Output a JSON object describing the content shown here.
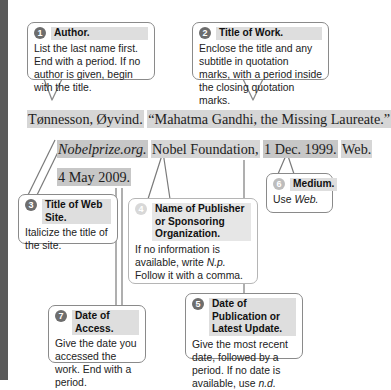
{
  "citation": {
    "line1": {
      "author": "Tønnesson, Øyvind.",
      "title_of_work": "“Mahatma Gandhi, the Missing Laureate.”"
    },
    "line2": {
      "web_site_title": "Nobelprize.org.",
      "publisher": "Nobel Foundation,",
      "pub_date": "1 Dec. 1999.",
      "medium": "Web."
    },
    "line3": {
      "access_date": "4 May 2009."
    }
  },
  "callouts": [
    {
      "number": "1",
      "title": "Author.",
      "body": "List the last name first. End with a period. If no author is given, begin with the title."
    },
    {
      "number": "2",
      "title": "Title of Work.",
      "body": "Enclose the title and any subtitle in quotation marks, with a period inside the closing quotation marks."
    },
    {
      "number": "3",
      "title": "Title of Web Site.",
      "body": "Italicize the title of the site."
    },
    {
      "number": "4",
      "title": "Name of Publisher or Sponsoring Organization.",
      "body_pre": "If no information is available, write ",
      "body_em": "N.p.",
      "body_post": " Follow it with a comma."
    },
    {
      "number": "5",
      "title": "Date of Publication or Latest Update.",
      "body_pre": "Give the most recent date, followed by a period. If no date is available, use ",
      "body_em": "n.d."
    },
    {
      "number": "6",
      "title": "Medium.",
      "body_pre": "Use ",
      "body_em": "Web."
    },
    {
      "number": "7",
      "title": "Date of Access.",
      "body": "Give the date you accessed the work. End with a period."
    }
  ]
}
